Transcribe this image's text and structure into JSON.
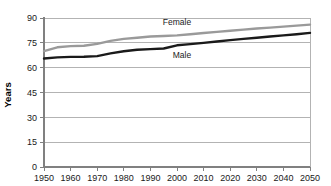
{
  "chart_data": {
    "type": "line",
    "title": "",
    "subtitle": "",
    "xlabel": "",
    "ylabel": "Years",
    "xlim": [
      1950,
      2050
    ],
    "ylim": [
      0,
      90
    ],
    "grid": true,
    "grid_axis": "y",
    "legend_position": "inline-annotation",
    "x_ticks": [
      1950,
      1960,
      1970,
      1980,
      1990,
      2000,
      2010,
      2020,
      2030,
      2040,
      2050
    ],
    "y_ticks": [
      0,
      15,
      30,
      45,
      60,
      75,
      90
    ],
    "x_tick_labels": [
      "1950",
      "1960",
      "1970",
      "1980",
      "1990",
      "2000",
      "2010",
      "2020",
      "2030",
      "2040",
      "2050"
    ],
    "y_tick_labels": [
      "0",
      "15",
      "30",
      "45",
      "60",
      "75",
      "90"
    ],
    "x": [
      1950,
      1955,
      1960,
      1965,
      1970,
      1975,
      1980,
      1985,
      1990,
      1995,
      2000,
      2005,
      2010,
      2015,
      2020,
      2025,
      2030,
      2035,
      2040,
      2045,
      2050
    ],
    "series": [
      {
        "name": "Female",
        "label": "Female",
        "color": "#9a9a9a",
        "stroke_width": 2.4,
        "values": [
          70.0,
          72.3,
          73.0,
          73.2,
          74.4,
          76.2,
          77.4,
          78.1,
          78.8,
          79.1,
          79.5,
          80.2,
          80.9,
          81.6,
          82.3,
          83.0,
          83.7,
          84.2,
          84.8,
          85.4,
          86.0
        ]
      },
      {
        "name": "Male",
        "label": "Male",
        "color": "#1a1a1a",
        "stroke_width": 2.4,
        "values": [
          65.5,
          66.2,
          66.5,
          66.6,
          67.0,
          68.6,
          69.9,
          70.8,
          71.2,
          71.6,
          73.5,
          74.2,
          75.0,
          75.8,
          76.6,
          77.4,
          78.1,
          78.8,
          79.5,
          80.2,
          81.0
        ]
      }
    ],
    "annotations": [
      {
        "text": "Female",
        "x": 1995,
        "y": 88.0,
        "series": "Female"
      },
      {
        "text": "Male",
        "x": 1998,
        "y": 67.0,
        "series": "Male"
      }
    ]
  },
  "axes": {
    "y_axis_title": "Years"
  }
}
